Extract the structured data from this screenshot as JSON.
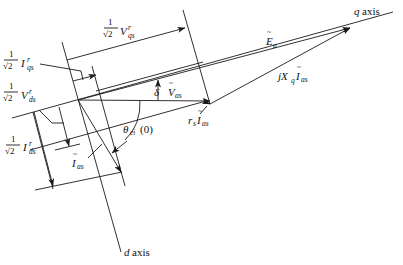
{
  "diagram": {
    "type": "phasor-diagram",
    "axes": {
      "q_axis_label": "q axis",
      "d_axis_label": "d axis"
    },
    "phasors": {
      "E_a": "Ẽa",
      "V_as": "Ṽas",
      "I_as": "Ĩas",
      "rs_Ias": "rsĨas",
      "jXq_Ias": "jXqĨas"
    },
    "angles": {
      "delta": "δ",
      "theta_ei": "θei (0)"
    },
    "dimensions": {
      "Vqs_label": "1/√2 V'qs",
      "Iqs_label": "1/√2 I'qs",
      "Vds_label": "1/√2 V'ds",
      "Ids_label": "1/√2 I'ds"
    },
    "text": {
      "one": "1",
      "sqrt2": "√2",
      "V": "V",
      "I": "I",
      "qs": "qs",
      "ds": "ds",
      "prime": "r",
      "E": "E",
      "a": "a",
      "as": "as",
      "r": "r",
      "s": "s",
      "j": "j",
      "X": "X",
      "q": "q",
      "delta": "δ",
      "theta": "θ",
      "ei": "ei",
      "zero": "(0)",
      "q_axis": "q axis",
      "d_axis": "d axis",
      "d": "d",
      "axis": "axis"
    },
    "colors": {
      "line": "#1a1a1a",
      "background": "#ffffff"
    }
  }
}
